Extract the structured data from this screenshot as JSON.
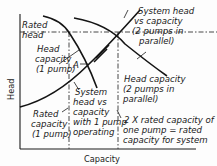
{
  "diagram": {
    "axes": {
      "x_label": "Capacity",
      "y_label": "Head"
    },
    "labels": {
      "rated_head_1": "Rated",
      "rated_head_2": "head",
      "head_cap_1p_1": "Head",
      "head_cap_1p_2": "capacity",
      "head_cap_1p_3": "(1 pump)",
      "point_a": "A",
      "sys_2p_1": "System head",
      "sys_2p_2": "vs capacity",
      "sys_2p_3": "(2 pumps in",
      "sys_2p_4": "parallel)",
      "head_cap_2p_1": "Head capacity",
      "head_cap_2p_2": "(2 pumps in",
      "head_cap_2p_3": "parallel)",
      "sys_1p_1": "System",
      "sys_1p_2": "head vs",
      "sys_1p_3": "capacity",
      "sys_1p_4": "with 1 pump",
      "sys_1p_5": "operating",
      "rated_cap_1": "Rated",
      "rated_cap_2": "capacity",
      "rated_cap_3": "(1 pump)",
      "twice_1": "2 X rated capacity of",
      "twice_2": "one pump = rated",
      "twice_3": "capacity for system"
    },
    "curves": [
      "Head capacity (1 pump)",
      "Head capacity (2 pumps in parallel)",
      "System head vs capacity (1 pump operating)",
      "System head vs capacity (2 pumps in parallel)"
    ]
  }
}
